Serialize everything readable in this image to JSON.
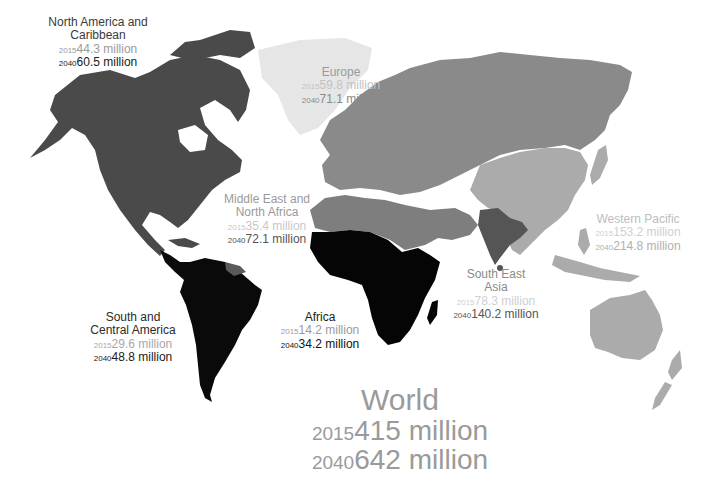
{
  "colors": {
    "north_america": "#4a4a4a",
    "south_central_america": "#0a0a0a",
    "africa": "#050505",
    "europe": "#8a8a8a",
    "middle_east_north_africa": "#7e7e7e",
    "south_east_asia": "#555555",
    "western_pacific": "#ababab",
    "greenland": "#e8e8e8",
    "label_dark": "#2a2a2a",
    "label_mid": "#8a8a8a",
    "label_light": "#bdbdbd"
  },
  "regions": [
    {
      "id": "north_america",
      "name_line1": "North America and",
      "name_line2": "Caribbean",
      "y2015_label": "2015",
      "v2015": "44.3 million",
      "y2040_label": "2040",
      "v2040": "60.5 million"
    },
    {
      "id": "europe",
      "name_line1": "Europe",
      "name_line2": "",
      "y2015_label": "2015",
      "v2015": "59.8 million",
      "y2040_label": "2040",
      "v2040": "71.1 million"
    },
    {
      "id": "middle_east_north_africa",
      "name_line1": "Middle East and",
      "name_line2": "North Africa",
      "y2015_label": "2015",
      "v2015": "35.4 million",
      "y2040_label": "2040",
      "v2040": "72.1 million"
    },
    {
      "id": "western_pacific",
      "name_line1": "Western Pacific",
      "name_line2": "",
      "y2015_label": "2015",
      "v2015": "153.2 million",
      "y2040_label": "2040",
      "v2040": "214.8 million"
    },
    {
      "id": "south_east_asia",
      "name_line1": "South East",
      "name_line2": "Asia",
      "y2015_label": "2015",
      "v2015": "78.3 million",
      "y2040_label": "2040",
      "v2040": "140.2 million"
    },
    {
      "id": "south_central_america",
      "name_line1": "South and",
      "name_line2": "Central America",
      "y2015_label": "2015",
      "v2015": "29.6 million",
      "y2040_label": "2040",
      "v2040": "48.8 million"
    },
    {
      "id": "africa",
      "name_line1": "Africa",
      "name_line2": "",
      "y2015_label": "2015",
      "v2015": "14.2 million",
      "y2040_label": "2040",
      "v2040": "34.2 million"
    }
  ],
  "world": {
    "title": "World",
    "y2015_label": "2015",
    "v2015": "415 million",
    "y2040_label": "2040",
    "v2040": "642 million"
  }
}
